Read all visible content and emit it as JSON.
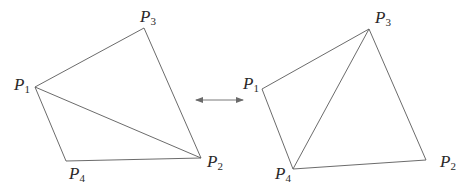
{
  "diagram": {
    "arrow": {
      "type": "double-headed",
      "x1": 196,
      "x2": 243,
      "y": 100
    },
    "left": {
      "vertices": {
        "P1": {
          "x": 35,
          "y": 87,
          "label": "P",
          "sub": "1",
          "lx": 14,
          "ly": 90
        },
        "P2": {
          "x": 201,
          "y": 158,
          "label": "P",
          "sub": "2",
          "lx": 207,
          "ly": 167
        },
        "P3": {
          "x": 144,
          "y": 28,
          "label": "P",
          "sub": "3",
          "lx": 140,
          "ly": 22
        },
        "P4": {
          "x": 66,
          "y": 161,
          "label": "P",
          "sub": "4",
          "lx": 69,
          "ly": 179
        }
      },
      "edges": [
        [
          "P1",
          "P3"
        ],
        [
          "P3",
          "P2"
        ],
        [
          "P2",
          "P4"
        ],
        [
          "P4",
          "P1"
        ],
        [
          "P1",
          "P2"
        ]
      ]
    },
    "right": {
      "vertices": {
        "P1": {
          "x": 262,
          "y": 89,
          "label": "P",
          "sub": "1",
          "lx": 243,
          "ly": 89
        },
        "P2": {
          "x": 426,
          "y": 160,
          "label": "P",
          "sub": "2",
          "lx": 440,
          "ly": 167
        },
        "P3": {
          "x": 369,
          "y": 29,
          "label": "P",
          "sub": "3",
          "lx": 375,
          "ly": 23
        },
        "P4": {
          "x": 293,
          "y": 169,
          "label": "P",
          "sub": "4",
          "lx": 275,
          "ly": 179
        }
      },
      "edges": [
        [
          "P1",
          "P3"
        ],
        [
          "P3",
          "P2"
        ],
        [
          "P2",
          "P4"
        ],
        [
          "P4",
          "P1"
        ],
        [
          "P3",
          "P4"
        ]
      ]
    }
  }
}
